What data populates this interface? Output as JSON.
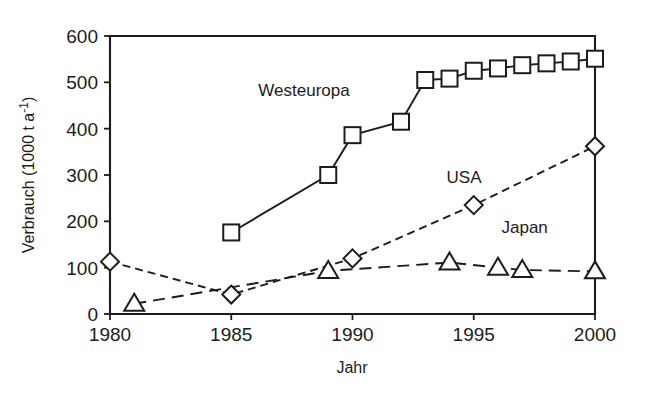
{
  "chart_data": {
    "type": "line",
    "title": "",
    "xlabel": "Jahr",
    "ylabel": "Verbrauch (1000 t a⁻¹)",
    "ylabel_parts": {
      "main": "Verbrauch (1000 t a",
      "exponent": "-1",
      "tail": ")"
    },
    "xlim": [
      1980,
      2000
    ],
    "ylim": [
      0,
      600
    ],
    "xticks": [
      1980,
      1985,
      1990,
      1995,
      2000
    ],
    "xtick_labels": [
      "1980",
      "1985",
      "1990",
      "1995",
      "2000"
    ],
    "yticks": [
      0,
      100,
      200,
      300,
      400,
      500,
      600
    ],
    "ytick_labels": [
      "0",
      "100",
      "200",
      "300",
      "400",
      "500",
      "600"
    ],
    "grid": false,
    "legend_position": "inline-annotations",
    "series": [
      {
        "name": "Westeuropa",
        "marker": "square",
        "linestyle": "solid",
        "color": "#1c1c1c",
        "label_x": 1988.0,
        "label_y": 470,
        "x": [
          1985,
          1989,
          1990,
          1992,
          1993,
          1994,
          1995,
          1996,
          1997,
          1998,
          1999,
          2000
        ],
        "values": [
          176,
          300,
          386,
          415,
          505,
          508,
          525,
          530,
          537,
          541,
          545,
          551
        ]
      },
      {
        "name": "USA",
        "marker": "diamond",
        "linestyle": "dashed",
        "color": "#1c1c1c",
        "label_x": 1994.6,
        "label_y": 283,
        "x": [
          1980,
          1985,
          1990,
          1995,
          2000
        ],
        "values": [
          113,
          42,
          120,
          235,
          362
        ]
      },
      {
        "name": "Japan",
        "marker": "triangle",
        "linestyle": "long-dashed",
        "color": "#1c1c1c",
        "label_x": 1997.1,
        "label_y": 175,
        "x": [
          1981,
          1989,
          1994,
          1996,
          1997,
          2000
        ],
        "values": [
          22,
          93,
          111,
          100,
          95,
          92
        ]
      }
    ]
  },
  "plot": {
    "left": 110,
    "right": 595,
    "top": 36,
    "bottom": 314,
    "tick_len": 6,
    "marker_size": 16
  }
}
